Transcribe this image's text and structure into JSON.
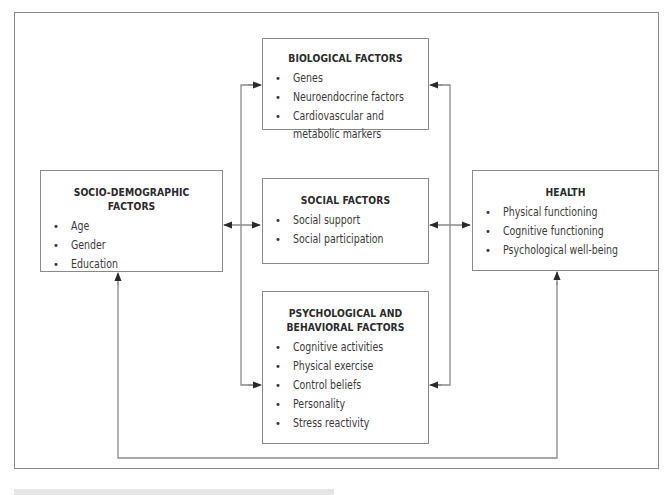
{
  "diagram": {
    "boxes": {
      "biological": {
        "title": "BIOLOGICAL FACTORS",
        "items": [
          "Genes",
          "Neuroendocrine factors",
          "Cardiovascular and",
          "metabolic markers"
        ]
      },
      "social": {
        "title": "SOCIAL FACTORS",
        "items": [
          "Social support",
          "Social participation"
        ]
      },
      "psychological": {
        "title_line1": "PSYCHOLOGICAL AND",
        "title_line2": "BEHAVIORAL FACTORS",
        "items": [
          "Cognitive activities",
          "Physical exercise",
          "Control beliefs",
          "Personality",
          "Stress reactivity"
        ]
      },
      "socio_demographic": {
        "title": "SOCIO-DEMOGRAPHIC FACTORS",
        "items": [
          "Age",
          "Gender",
          "Education"
        ]
      },
      "health": {
        "title": "HEALTH",
        "items": [
          "Physical functioning",
          "Cognitive functioning",
          "Psychological well-being"
        ]
      }
    },
    "bullet_glyph": "•",
    "colors": {
      "line": "#8a8a8a",
      "arrow": "#2a2a2a",
      "text": "#333333"
    }
  }
}
